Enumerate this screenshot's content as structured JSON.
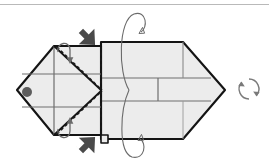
{
  "diagram": {
    "background_color": "#ffffff",
    "paper_fill": "#ececec",
    "paper_fill_light": "#f2f2f2",
    "outline_color": "#141414",
    "crease_color": "#6e6e6e",
    "dashed_fold_color": "#1a1a1a",
    "arrow_black_color": "#4a4a4a",
    "thin_arrow_color": "#6b6b6b",
    "top_rule_color": "#b9b9b9",
    "marker_dot_color": "#5d5d5d"
  },
  "shapes": {
    "left_panel": {
      "name": "left-folded-flap",
      "description": "Pentagon flap pointing left with vertical and horizontal creases",
      "points": "17,90 54,46 101,46 101,135 54,135",
      "creases": [
        {
          "name": "crease-horizontal-upper",
          "d": "M 23,74 L 101,74"
        },
        {
          "name": "crease-horizontal-lower",
          "d": "M 23,107 L 101,107"
        },
        {
          "name": "crease-vertical",
          "d": "M 54,46 L 54,135"
        }
      ]
    },
    "right_panel": {
      "name": "right-body-pentagon",
      "description": "Pentagon body pointing right with horizontal creases",
      "points": "101,42 183,42 225,90 183,139 101,139",
      "creases": [
        {
          "name": "crease-horizontal-upper",
          "d": "M 101,78 L 210,78"
        },
        {
          "name": "crease-horizontal-lower",
          "d": "M 101,101 L 210,101"
        },
        {
          "name": "crease-vertical-short",
          "d": "M 158,78 L 158,101"
        },
        {
          "name": "crease-diagonal-tip-upper",
          "d": "M 183,42 L 183,78"
        },
        {
          "name": "crease-edge-left",
          "d": "M 101,42 L 101,139"
        }
      ]
    },
    "small_tab": {
      "name": "bottom-small-tab",
      "points": "101,135 108,135 108,143 101,143"
    }
  },
  "fold_lines": {
    "dashed": [
      {
        "name": "valley-fold-upper-diagonal",
        "d": "M 56,47 L 101,90"
      },
      {
        "name": "valley-fold-lower-diagonal",
        "d": "M 56,134 L 101,91"
      },
      {
        "name": "valley-fold-vertical",
        "d": "M 101,46 L 101,135"
      }
    ],
    "solid_diagonals": [
      {
        "name": "edge-upper-diagonal",
        "d": "M 54,46 L 101,90"
      },
      {
        "name": "edge-lower-diagonal",
        "d": "M 54,135 L 101,91"
      }
    ]
  },
  "markers": {
    "dot": {
      "name": "reference-dot",
      "cx": 27,
      "cy": 92,
      "r": 5
    }
  },
  "arrows": {
    "push_top": {
      "name": "push-arrow-top",
      "direction": "down-right",
      "x": 78,
      "y": 27
    },
    "push_bottom": {
      "name": "push-arrow-bottom",
      "direction": "up-right",
      "x": 78,
      "y": 140
    },
    "corner_top": {
      "name": "corner-curl-arrow-top",
      "direction": "down"
    },
    "corner_bottom": {
      "name": "corner-curl-arrow-bottom",
      "direction": "up"
    },
    "wrap_top": {
      "name": "wrap-around-arrow-top",
      "direction": "clockwise"
    },
    "wrap_bottom": {
      "name": "wrap-around-arrow-bottom",
      "direction": "clockwise"
    },
    "rotate": {
      "name": "turn-over-rotate-icon",
      "cx": 249,
      "cy": 89,
      "r": 10
    }
  },
  "labels": {
    "caption": ""
  }
}
